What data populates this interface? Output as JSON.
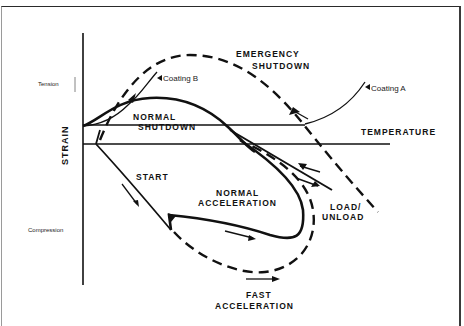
{
  "figure": {
    "axis": {
      "y_label": "STRAIN",
      "tension_label": "Tension",
      "compression_label": "Compression"
    },
    "regions": {
      "emergency_shutdown": [
        "EMERGENCY",
        "SHUTDOWN"
      ],
      "normal_shutdown": [
        "NORMAL",
        "SHUTDOWN"
      ],
      "temperature": "TEMPERATURE",
      "start": "START",
      "normal_acceleration": [
        "NORMAL",
        "ACCELERATION"
      ],
      "load_unload": [
        "LOAD/",
        "UNLOAD"
      ],
      "fast_acceleration": [
        "FAST",
        "ACCELERATION"
      ]
    },
    "annotations": {
      "coating_a": "Coating A",
      "coating_b": "Coating B"
    },
    "colors": {
      "ink": "#111111",
      "background": "#ffffff"
    }
  }
}
